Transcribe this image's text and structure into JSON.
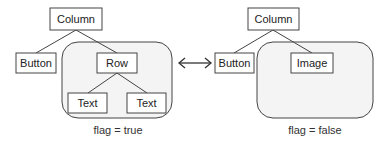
{
  "diagram": {
    "left_tree": {
      "root": "Column",
      "children": [
        "Button",
        "Row"
      ],
      "row_children": [
        "Text",
        "Text"
      ],
      "caption": "flag = true"
    },
    "connector": {
      "icon": "double-arrow-icon",
      "glyph": "⟷"
    },
    "right_tree": {
      "root": "Column",
      "children": [
        "Button",
        "Image"
      ],
      "caption": "flag = false"
    },
    "colors": {
      "stroke": "#444444",
      "box_fill": "#ffffff",
      "region_fill": "#f4f4f4",
      "text": "#222222"
    }
  }
}
